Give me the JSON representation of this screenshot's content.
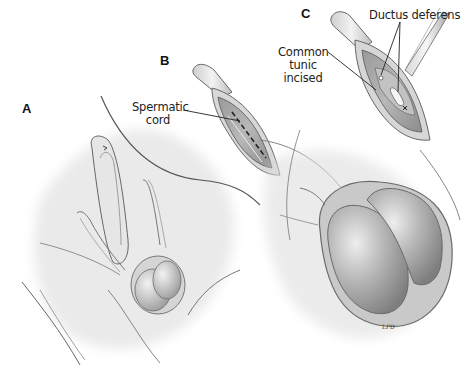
{
  "figure": {
    "panels": [
      {
        "id": "A",
        "label": "A",
        "description": "Overview of scrotal region with inguinal area"
      },
      {
        "id": "B",
        "label": "B",
        "description": "Skin incision exposing spermatic cord"
      },
      {
        "id": "C",
        "label": "C",
        "description": "Common tunic incised exposing ductus deferens, with forceps"
      }
    ],
    "callouts": {
      "spermatic_cord_line1": "Spermatic",
      "spermatic_cord_line2": "cord",
      "ductus_deferens": "Ductus deferens",
      "common_tunic_line1": "Common",
      "common_tunic_line2": "tunic",
      "common_tunic_line3": "incised"
    },
    "signature": "LPD"
  },
  "colors": {
    "background": "#ffffff",
    "outline": "#555555",
    "shade_dark": "#8a8a8a",
    "shade_mid": "#b5b5b5",
    "shade_light": "#e4e4e4",
    "label_text": "#111111"
  }
}
